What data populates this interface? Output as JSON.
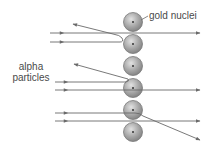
{
  "diagram": {
    "labels": {
      "gold_nuclei": "gold nuclei",
      "alpha_line1": "alpha",
      "alpha_line2": "particles"
    },
    "colors": {
      "line": "#6a6a6a",
      "nucleus_fill": "#a9a9a9",
      "nucleus_stroke": "#7a7a7a",
      "nucleus_dot": "#333333",
      "text": "#4a4a4a"
    },
    "nuclei": [
      {
        "cx": 133,
        "cy": 22,
        "r": 9.5
      },
      {
        "cx": 133,
        "cy": 44,
        "r": 9.5
      },
      {
        "cx": 133,
        "cy": 66,
        "r": 9.5
      },
      {
        "cx": 133,
        "cy": 88,
        "r": 9.5
      },
      {
        "cx": 133,
        "cy": 110,
        "r": 9.5
      },
      {
        "cx": 133,
        "cy": 132,
        "r": 9.5
      }
    ],
    "paths": [
      {
        "type": "straight",
        "y": 33
      },
      {
        "type": "reflected",
        "y": 42
      },
      {
        "type": "reflected",
        "y": 82
      },
      {
        "type": "straight",
        "y": 90
      },
      {
        "type": "deflected",
        "y": 113
      },
      {
        "type": "straight",
        "y": 121
      }
    ]
  }
}
